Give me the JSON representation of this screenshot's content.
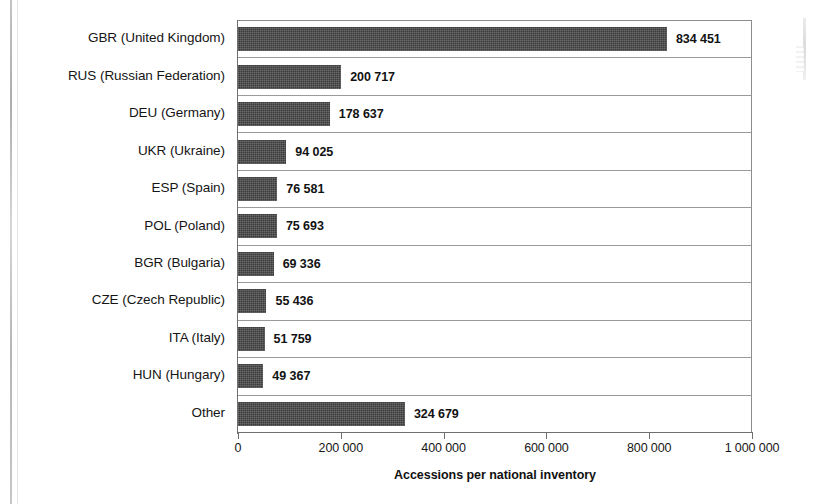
{
  "chart_data": {
    "type": "bar",
    "orientation": "horizontal",
    "title": "",
    "xlabel": "Accessions per national inventory",
    "ylabel": "",
    "xlim": [
      0,
      1000000
    ],
    "xticks": [
      "0",
      "200 000",
      "400 000",
      "600 000",
      "800 000",
      "1 000 000"
    ],
    "xtick_values": [
      0,
      200000,
      400000,
      600000,
      800000,
      1000000
    ],
    "grid": true,
    "legend": "none",
    "categories": [
      "GBR (United Kingdom)",
      "RUS (Russian Federation)",
      "DEU (Germany)",
      "UKR (Ukraine)",
      "ESP (Spain)",
      "POL (Poland)",
      "BGR (Bulgaria)",
      "CZE (Czech Republic)",
      "ITA (Italy)",
      "HUN (Hungary)",
      "Other"
    ],
    "values": [
      834451,
      200717,
      178637,
      94025,
      76581,
      75693,
      69336,
      55436,
      51759,
      49367,
      324679
    ],
    "value_labels": [
      "834 451",
      "200 717",
      "178 637",
      "94 025",
      "76 581",
      "75 693",
      "69 336",
      "55 436",
      "51 759",
      "49 367",
      "324 679"
    ],
    "bar_color": "#3c3c3c",
    "axis_color": "#6f6f6f",
    "gridline_color": "#9a9a9a"
  }
}
